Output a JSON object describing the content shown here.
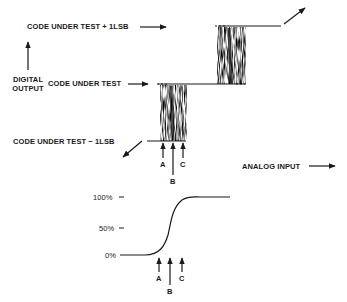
{
  "diagram": {
    "top": {
      "label_plus": "CODE UNDER TEST  + 1LSB",
      "label_code": "CODE UNDER TEST",
      "label_minus": "CODE UNDER TEST  − 1LSB",
      "y_axis_label_line1": "DIGITAL",
      "y_axis_label_line2": "OUTPUT",
      "x_axis_label": "ANALOG INPUT",
      "markers": [
        "A",
        "B",
        "C"
      ]
    },
    "bottom": {
      "ticks": [
        "100%",
        "50%",
        "0%"
      ],
      "markers": [
        "A",
        "B",
        "C"
      ]
    },
    "colors": {
      "ink": "#1a1a1a",
      "background": "#ffffff"
    }
  }
}
